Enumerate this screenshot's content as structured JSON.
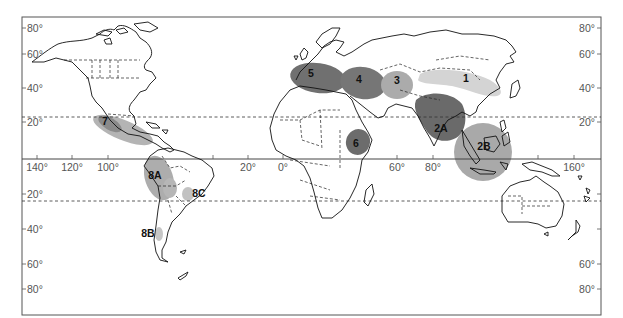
{
  "map": {
    "projection": "equirectangular world map",
    "colors": {
      "dark_region": "#6e6e6e",
      "medium_region": "#a8a8a8",
      "light_region": "#d2d2d2",
      "coastline": "#111111",
      "frame": "#555555"
    },
    "left_axis_labels": [
      {
        "text": "80°",
        "y": 31
      },
      {
        "text": "60°",
        "y": 57
      },
      {
        "text": "40°",
        "y": 91
      },
      {
        "text": "20°",
        "y": 125
      },
      {
        "text": "20°",
        "y": 197
      },
      {
        "text": "40°",
        "y": 232
      },
      {
        "text": "60°",
        "y": 267
      },
      {
        "text": "80°",
        "y": 292
      }
    ],
    "right_axis_labels": [
      {
        "text": "80°",
        "y": 31
      },
      {
        "text": "60°",
        "y": 57
      },
      {
        "text": "40°",
        "y": 91
      },
      {
        "text": "20°",
        "y": 125
      },
      {
        "text": "60°",
        "y": 267
      },
      {
        "text": "80°",
        "y": 292
      }
    ],
    "equator_labels": [
      {
        "text": "140°",
        "x": 37
      },
      {
        "text": "120°",
        "x": 72
      },
      {
        "text": "100°",
        "x": 108
      },
      {
        "text": "20°",
        "x": 248
      },
      {
        "text": "0°",
        "x": 283
      },
      {
        "text": "60°",
        "x": 397
      },
      {
        "text": "80°",
        "x": 433
      },
      {
        "text": "160°",
        "x": 574
      }
    ],
    "reference_lines": {
      "tropic_of_cancer_y": 117,
      "equator_y": 159,
      "tropic_of_capricorn_y": 201
    },
    "regions": [
      {
        "label": "1",
        "shade": "light",
        "x": 466,
        "y": 82
      },
      {
        "label": "2A",
        "shade": "dark",
        "x": 441,
        "y": 132
      },
      {
        "label": "2B",
        "shade": "medium",
        "x": 484,
        "y": 150
      },
      {
        "label": "3",
        "shade": "medium",
        "x": 397,
        "y": 84
      },
      {
        "label": "4",
        "shade": "dark",
        "x": 359,
        "y": 83
      },
      {
        "label": "5",
        "shade": "dark",
        "x": 311,
        "y": 77
      },
      {
        "label": "6",
        "shade": "dark",
        "x": 356,
        "y": 147
      },
      {
        "label": "7",
        "shade": "medium",
        "x": 105,
        "y": 125
      },
      {
        "label": "8A",
        "shade": "medium",
        "x": 155,
        "y": 179
      },
      {
        "label": "8B",
        "shade": "light",
        "x": 148,
        "y": 237
      },
      {
        "label": "8C",
        "shade": "light",
        "x": 199,
        "y": 197
      }
    ]
  }
}
